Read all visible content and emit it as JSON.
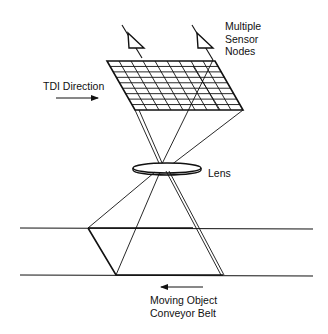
{
  "diagram": {
    "type": "tdi-imaging-setup",
    "labels": {
      "sensor_nodes": [
        "Multiple",
        "Sensor",
        "Nodes"
      ],
      "tdi_direction": "TDI Direction",
      "lens": "Lens",
      "conveyor": [
        "Moving Object",
        "Conveyor Belt"
      ]
    },
    "components": {
      "sensor_nodes_count": 2,
      "sensor_grid": {
        "columns": 9,
        "rows": 9
      },
      "arrows": {
        "tdi_direction": "right",
        "conveyor_motion": "left"
      }
    },
    "colors": {
      "line": "#111111",
      "background": "#ffffff"
    }
  }
}
